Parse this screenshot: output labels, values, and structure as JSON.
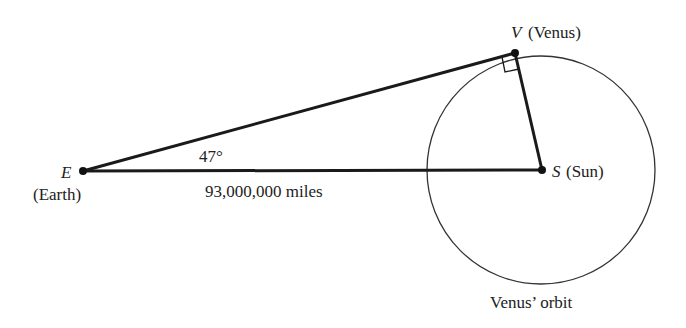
{
  "diagram": {
    "points": {
      "E": {
        "letter": "E",
        "name": "(Earth)"
      },
      "V": {
        "letter": "V",
        "name": "(Venus)"
      },
      "S": {
        "letter": "S",
        "name": "(Sun)"
      }
    },
    "angle_label": "47°",
    "distance_label": "93,000,000 miles",
    "orbit_label": "Venus’ orbit",
    "colors": {
      "line": "#1a1a1a",
      "text": "#222222",
      "background": "#ffffff"
    }
  }
}
